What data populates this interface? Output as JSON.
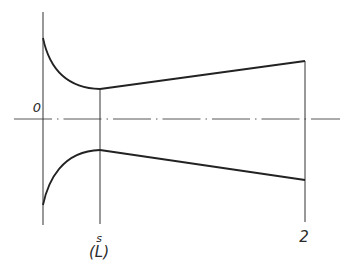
{
  "diagram": {
    "type": "nozzle-profile",
    "colors": {
      "stroke": "#2a2a2a",
      "background": "#ffffff"
    },
    "labels": {
      "origin": "0",
      "throat": "s",
      "throat_sub": "(L)",
      "exit": "2"
    },
    "geometry": {
      "axis_y": 119,
      "inlet_x": 43,
      "throat_x": 100,
      "exit_x": 305,
      "upper_inlet_y": 38,
      "upper_throat_y": 89,
      "upper_exit_y": 61,
      "lower_inlet_y": 205,
      "lower_throat_y": 150,
      "lower_exit_y": 180
    }
  }
}
